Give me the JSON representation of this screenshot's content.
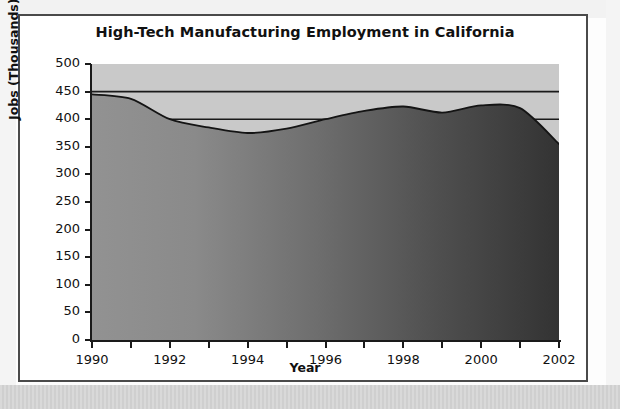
{
  "chart_data": {
    "type": "area",
    "title": "High-Tech Manufacturing Employment in California",
    "xlabel": "Year",
    "ylabel": "Jobs (Thousands)",
    "x": [
      1990,
      1991,
      1992,
      1993,
      1994,
      1995,
      1996,
      1997,
      1998,
      1999,
      2000,
      2001,
      2002
    ],
    "values": [
      445,
      437,
      400,
      385,
      375,
      383,
      400,
      415,
      423,
      412,
      425,
      420,
      355
    ],
    "series": [
      {
        "name": "High-Tech Manufacturing Jobs",
        "values": [
          445,
          437,
          400,
          385,
          375,
          383,
          400,
          415,
          423,
          412,
          425,
          420,
          355
        ]
      }
    ],
    "xlim": [
      1990,
      2002
    ],
    "ylim": [
      0,
      500
    ],
    "ytick_values": [
      0,
      50,
      100,
      150,
      200,
      250,
      300,
      350,
      400,
      450,
      500
    ],
    "ytick_labels": [
      "0",
      "50",
      "100",
      "150",
      "200",
      "250",
      "300",
      "350",
      "400",
      "450",
      "500"
    ],
    "xtick_values": [
      1990,
      1991,
      1992,
      1993,
      1994,
      1995,
      1996,
      1997,
      1998,
      1999,
      2000,
      2001,
      2002
    ],
    "xtick_labels": [
      "1990",
      "",
      "1992",
      "",
      "1994",
      "",
      "1996",
      "",
      "1998",
      "",
      "2000",
      "",
      "2002"
    ],
    "gridlines": {
      "horizontal_values": [
        400,
        450
      ],
      "vertical": false
    },
    "legend": null,
    "annotations": [],
    "colors": {
      "plot_background": "#c9c9c9",
      "area_fill_left": "#8d8d8d",
      "area_fill_right": "#3a3a3a",
      "line": "#1a1a1a",
      "axis": "#1a1a1a",
      "gridline": "#1a1a1a",
      "frame_border": "#4a4a4a",
      "page_background": "#ffffff",
      "text": "#111111"
    }
  }
}
